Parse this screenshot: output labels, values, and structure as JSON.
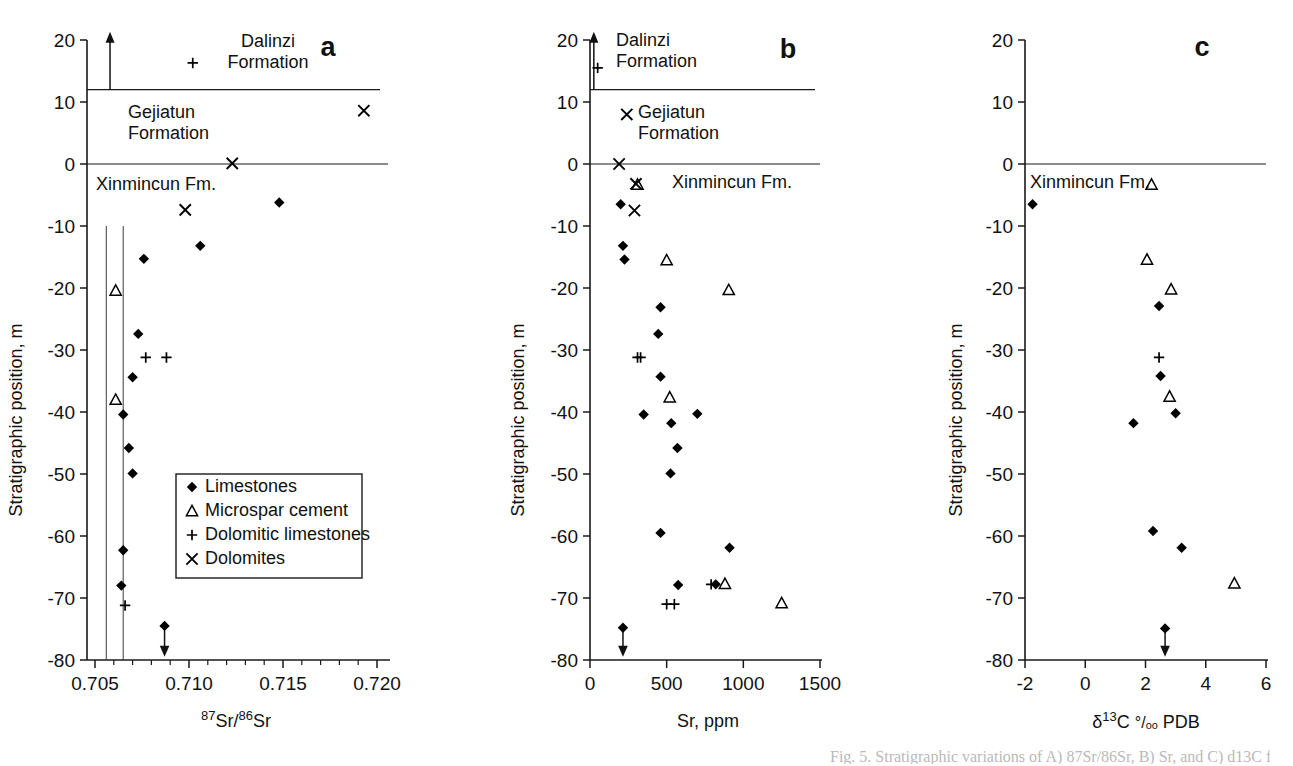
{
  "figure": {
    "y_axis_title": "Stratigraphic position, m",
    "y_ticks": [
      "20",
      "10",
      "0",
      "-10",
      "-20",
      "-30",
      "-40",
      "-50",
      "-60",
      "-70",
      "-80"
    ],
    "legend": {
      "items": [
        {
          "symbol": "diamond",
          "label": "Limestones"
        },
        {
          "symbol": "triangle",
          "label": "Microspar cement"
        },
        {
          "symbol": "plus",
          "label": "Dolomitic limestones"
        },
        {
          "symbol": "cross",
          "label": "Dolomites"
        }
      ]
    },
    "formations": {
      "dalinzi": "Dalinzi\nFormation",
      "dalinzi_line1": "Dalinzi",
      "dalinzi_line2": "Formation",
      "gejiatun_line1": "Gejiatun",
      "gejiatun_line2": "Formation",
      "xinmincun": "Xinmincun Fm."
    },
    "bottom_caption_fragment": "Fig. 5. Stratigraphic variations of A) 87Sr/86Sr, B) Sr, and C) d13C for"
  },
  "chart_data": [
    {
      "panel": "a",
      "type": "scatter",
      "title": "a",
      "xlabel": "87Sr/86Sr",
      "xlabel_sup1": "87",
      "xlabel_txt1": "Sr/",
      "xlabel_sup2": "86",
      "xlabel_txt2": "Sr",
      "ylabel": "Stratigraphic position, m",
      "xlim": [
        0.705,
        0.72
      ],
      "ylim": [
        -80,
        20
      ],
      "xticks": [
        0.705,
        0.71,
        0.715,
        0.72
      ],
      "xtick_labels": [
        "0.705",
        "0.710",
        "0.715",
        "0.720"
      ],
      "yticks": [
        20,
        10,
        0,
        -10,
        -20,
        -30,
        -40,
        -50,
        -60,
        -70,
        -80
      ],
      "grid": false,
      "legend_position": "lower-center",
      "reference_lines_x": [
        0.7056,
        0.7065
      ],
      "reference_line_yrange": [
        -80,
        -10
      ],
      "formation_boundaries_y": [
        12,
        0
      ],
      "up_arrow": {
        "x": 0.7058,
        "y_from": 12,
        "y_to": 21
      },
      "down_arrow": {
        "x": 0.7087,
        "y_from": -74.5,
        "y_to": -79
      },
      "series": [
        {
          "name": "Limestones",
          "symbol": "diamond",
          "points": [
            {
              "x": 0.7148,
              "y": -6.2
            },
            {
              "x": 0.7106,
              "y": -13.2
            },
            {
              "x": 0.7076,
              "y": -15.3
            },
            {
              "x": 0.7073,
              "y": -27.4
            },
            {
              "x": 0.707,
              "y": -34.4
            },
            {
              "x": 0.7065,
              "y": -40.4
            },
            {
              "x": 0.7068,
              "y": -45.8
            },
            {
              "x": 0.707,
              "y": -49.9
            },
            {
              "x": 0.7065,
              "y": -62.3
            },
            {
              "x": 0.7064,
              "y": -68.0
            },
            {
              "x": 0.7087,
              "y": -74.5
            }
          ]
        },
        {
          "name": "Microspar cement",
          "symbol": "triangle",
          "points": [
            {
              "x": 0.7061,
              "y": -20.4
            },
            {
              "x": 0.7061,
              "y": -38.0
            }
          ]
        },
        {
          "name": "Dolomitic limestones",
          "symbol": "plus",
          "points": [
            {
              "x": 0.7102,
              "y": 16.3
            },
            {
              "x": 0.7077,
              "y": -31.2
            },
            {
              "x": 0.7088,
              "y": -31.2
            },
            {
              "x": 0.7066,
              "y": -71.2
            }
          ]
        },
        {
          "name": "Dolomites",
          "symbol": "cross",
          "points": [
            {
              "x": 0.7193,
              "y": 8.6
            },
            {
              "x": 0.7123,
              "y": 0.1
            },
            {
              "x": 0.7098,
              "y": -7.4
            }
          ]
        }
      ]
    },
    {
      "panel": "b",
      "type": "scatter",
      "title": "b",
      "xlabel": "Sr, ppm",
      "ylabel": "Stratigraphic position, m",
      "xlim": [
        0,
        1500
      ],
      "ylim": [
        -80,
        20
      ],
      "xticks": [
        0,
        500,
        1000,
        1500
      ],
      "xtick_labels": [
        "0",
        "500",
        "1000",
        "1500"
      ],
      "yticks": [
        20,
        10,
        0,
        -10,
        -20,
        -30,
        -40,
        -50,
        -60,
        -70,
        -80
      ],
      "grid": false,
      "formation_boundaries_y": [
        12,
        0
      ],
      "up_arrow": {
        "x": 25,
        "y_from": 12,
        "y_to": 21
      },
      "down_arrow": {
        "x": 215,
        "y_from": -74.8,
        "y_to": -79
      },
      "series": [
        {
          "name": "Limestones",
          "symbol": "diamond",
          "points": [
            {
              "x": 200,
              "y": -6.5
            },
            {
              "x": 215,
              "y": -13.2
            },
            {
              "x": 225,
              "y": -15.4
            },
            {
              "x": 460,
              "y": -23.1
            },
            {
              "x": 445,
              "y": -27.4
            },
            {
              "x": 460,
              "y": -34.3
            },
            {
              "x": 350,
              "y": -40.4
            },
            {
              "x": 700,
              "y": -40.3
            },
            {
              "x": 530,
              "y": -41.8
            },
            {
              "x": 570,
              "y": -45.8
            },
            {
              "x": 525,
              "y": -49.9
            },
            {
              "x": 460,
              "y": -59.5
            },
            {
              "x": 910,
              "y": -61.9
            },
            {
              "x": 575,
              "y": -67.9
            },
            {
              "x": 820,
              "y": -67.8
            },
            {
              "x": 215,
              "y": -74.8
            }
          ]
        },
        {
          "name": "Microspar cement",
          "symbol": "triangle",
          "points": [
            {
              "x": 310,
              "y": -3.3
            },
            {
              "x": 500,
              "y": -15.5
            },
            {
              "x": 905,
              "y": -20.3
            },
            {
              "x": 520,
              "y": -37.6
            },
            {
              "x": 880,
              "y": -67.7
            },
            {
              "x": 1250,
              "y": -70.8
            }
          ]
        },
        {
          "name": "Dolomitic limestones",
          "symbol": "plus",
          "points": [
            {
              "x": 50,
              "y": 15.5
            },
            {
              "x": 310,
              "y": -31.2
            },
            {
              "x": 330,
              "y": -31.2
            },
            {
              "x": 790,
              "y": -67.8
            },
            {
              "x": 500,
              "y": -71.0
            },
            {
              "x": 550,
              "y": -71.0
            }
          ]
        },
        {
          "name": "Dolomites",
          "symbol": "cross",
          "points": [
            {
              "x": 240,
              "y": 8.0
            },
            {
              "x": 190,
              "y": 0.0
            },
            {
              "x": 300,
              "y": -3.2
            },
            {
              "x": 290,
              "y": -7.5
            }
          ]
        }
      ]
    },
    {
      "panel": "c",
      "type": "scatter",
      "title": "c",
      "xlabel": "d13C permil PDB",
      "xlabel_delta": "δ",
      "xlabel_sup": "13",
      "xlabel_c": "C",
      "xlabel_permil": "°/ₒₒ",
      "xlabel_pdb": "PDB",
      "ylabel": "Stratigraphic position, m",
      "xlim": [
        -2,
        6
      ],
      "ylim": [
        -80,
        20
      ],
      "xticks": [
        -2,
        0,
        2,
        4,
        6
      ],
      "xtick_labels": [
        "-2",
        "0",
        "2",
        "4",
        "6"
      ],
      "yticks": [
        20,
        10,
        0,
        -10,
        -20,
        -30,
        -40,
        -50,
        -60,
        -70,
        -80
      ],
      "grid": false,
      "formation_boundaries_y": [
        0
      ],
      "down_arrow": {
        "x": 2.65,
        "y_from": -74.9,
        "y_to": -79
      },
      "series": [
        {
          "name": "Limestones",
          "symbol": "diamond",
          "points": [
            {
              "x": -1.75,
              "y": -6.5
            },
            {
              "x": 2.45,
              "y": -22.9
            },
            {
              "x": 2.5,
              "y": -34.2
            },
            {
              "x": 3.0,
              "y": -40.2
            },
            {
              "x": 1.6,
              "y": -41.8
            },
            {
              "x": 2.25,
              "y": -59.2
            },
            {
              "x": 3.2,
              "y": -61.9
            },
            {
              "x": 2.65,
              "y": -74.9
            }
          ]
        },
        {
          "name": "Microspar cement",
          "symbol": "triangle",
          "points": [
            {
              "x": 2.2,
              "y": -3.3
            },
            {
              "x": 2.05,
              "y": -15.4
            },
            {
              "x": 2.85,
              "y": -20.2
            },
            {
              "x": 2.8,
              "y": -37.5
            },
            {
              "x": 4.95,
              "y": -67.6
            }
          ]
        },
        {
          "name": "Dolomitic limestones",
          "symbol": "plus",
          "points": [
            {
              "x": 2.45,
              "y": -31.2
            }
          ]
        },
        {
          "name": "Dolomites",
          "symbol": "cross",
          "points": []
        }
      ]
    }
  ]
}
